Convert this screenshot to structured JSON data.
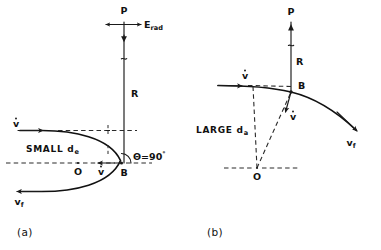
{
  "figure": {
    "background_color": "#ffffff",
    "line_color": "#111111",
    "panels": [
      {
        "id": "a",
        "caption": "(a)",
        "condition_label": "SMALL",
        "impact_parameter_symbol": "d",
        "impact_parameter_subscript": "e",
        "labels": {
          "field_point": "P",
          "field_vector": "E",
          "field_vector_subscript": "rad",
          "radius": "R",
          "scatter_point": "B",
          "center": "O",
          "velocity_initial": "v",
          "velocity_change": "v",
          "velocity_final": "v",
          "velocity_final_subscript": "f",
          "angle_symbol": "Θ",
          "angle_equals": "=",
          "angle_value": "90",
          "angle_degree": "°"
        }
      },
      {
        "id": "b",
        "caption": "(b)",
        "condition_label": "LARGE",
        "impact_parameter_symbol": "d",
        "impact_parameter_subscript": "a",
        "labels": {
          "field_point": "P",
          "radius": "R",
          "scatter_point": "B",
          "center": "O",
          "velocity_initial": "v",
          "velocity_change": "v",
          "velocity_final": "v",
          "velocity_final_subscript": "f"
        }
      }
    ]
  }
}
